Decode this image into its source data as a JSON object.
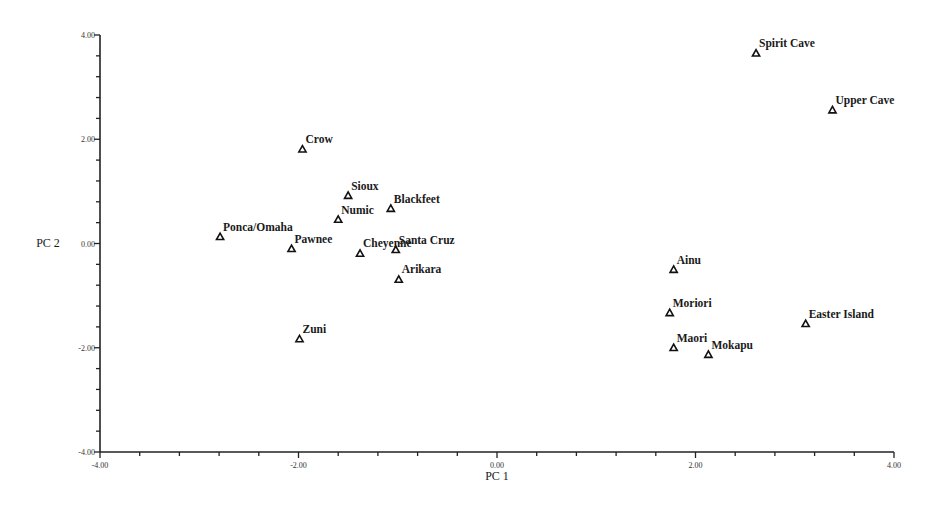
{
  "chart_data": {
    "type": "scatter",
    "title": "",
    "xlabel": "PC 1",
    "ylabel": "PC 2",
    "xlim": [
      -4,
      4
    ],
    "ylim": [
      -4,
      4
    ],
    "x_ticks": [
      "-4.00",
      "-2.00",
      "0.00",
      "2.00",
      "4.00"
    ],
    "y_ticks": [
      "4.00",
      "2.00",
      "0.00",
      "-2.00",
      "-4.00"
    ],
    "minor_tick_step": 0.4,
    "grid": false,
    "legend": null,
    "marker": "open-triangle",
    "points": [
      {
        "label": "Spirit Cave",
        "x": 2.61,
        "y": 3.65
      },
      {
        "label": "Upper Cave",
        "x": 3.38,
        "y": 2.56
      },
      {
        "label": "Crow",
        "x": -1.96,
        "y": 1.81
      },
      {
        "label": "Sioux",
        "x": -1.5,
        "y": 0.92
      },
      {
        "label": "Blackfeet",
        "x": -1.07,
        "y": 0.67
      },
      {
        "label": "Numic",
        "x": -1.6,
        "y": 0.46
      },
      {
        "label": "Ponca/Omaha",
        "x": -2.79,
        "y": 0.13
      },
      {
        "label": "Pawnee",
        "x": -2.07,
        "y": -0.1
      },
      {
        "label": "Cheyenne",
        "x": -1.38,
        "y": -0.19
      },
      {
        "label": "Santa Cruz",
        "x": -1.02,
        "y": -0.12
      },
      {
        "label": "Arikara",
        "x": -0.99,
        "y": -0.69
      },
      {
        "label": "Zuni",
        "x": -1.99,
        "y": -1.83
      },
      {
        "label": "Ainu",
        "x": 1.78,
        "y": -0.5
      },
      {
        "label": "Moriori",
        "x": 1.74,
        "y": -1.33
      },
      {
        "label": "Maori",
        "x": 1.78,
        "y": -2.0
      },
      {
        "label": "Mokapu",
        "x": 2.13,
        "y": -2.13
      },
      {
        "label": "Easter Island",
        "x": 3.11,
        "y": -1.54
      }
    ]
  }
}
